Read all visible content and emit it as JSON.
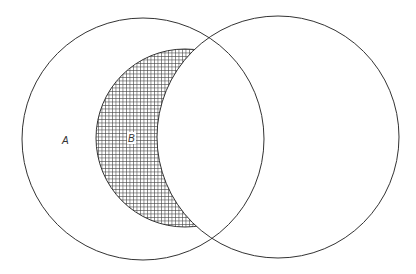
{
  "diagram": {
    "type": "venn",
    "colors": {
      "stroke": "#333333",
      "hatch": "#444444",
      "background": "#ffffff"
    },
    "labels": {
      "a": "A",
      "b": "B"
    },
    "shapes": {
      "circle_a": {
        "cx": 143,
        "cy": 139,
        "r": 121
      },
      "circle_right": {
        "cx": 278,
        "cy": 137,
        "r": 121
      },
      "circle_b": {
        "cx": 185,
        "cy": 138,
        "r": 89
      }
    },
    "hatched_region": "B minus right circle"
  }
}
